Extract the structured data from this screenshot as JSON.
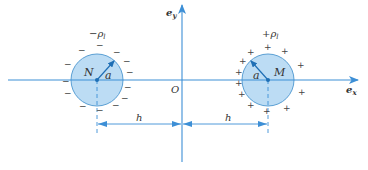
{
  "colors": {
    "axis": "#3d8fd6",
    "circle_fill": "#bcdcf4",
    "circle_stroke": "#5a9fd4",
    "radius_arrow": "#1f6fb5",
    "text": "#333333",
    "dimension": "#3d8fd6"
  },
  "axes": {
    "x_label": "e",
    "x_sub": "x",
    "y_label": "e",
    "y_sub": "y",
    "origin_label": "O"
  },
  "left_line": {
    "name": "N",
    "radius_label": "a",
    "charge_label": "−ρ",
    "charge_sub": "l",
    "charge_sign": "−"
  },
  "right_line": {
    "name": "M",
    "radius_label": "a",
    "charge_label": "+ρ",
    "charge_sub": "l",
    "charge_sign": "+"
  },
  "dimensions": {
    "left_label": "h",
    "right_label": "h"
  }
}
